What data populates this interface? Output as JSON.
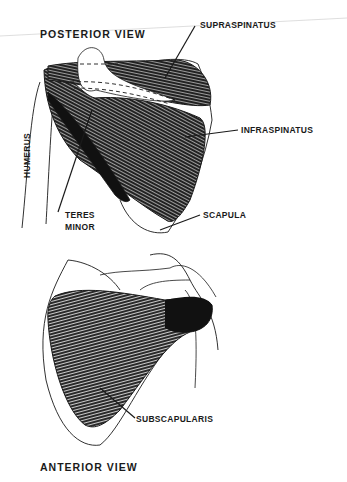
{
  "posterior": {
    "title": "POSTERIOR   VIEW",
    "labels": {
      "supraspinatus": "SUPRASPINATUS",
      "infraspinatus": "INFRASPINATUS",
      "humerus": "HUMERUS",
      "teres_minor_1": "TERES",
      "teres_minor_2": "MINOR",
      "scapula": "SCAPULA"
    }
  },
  "anterior": {
    "title": "ANTERIOR   VIEW",
    "labels": {
      "subscapularis": "SUBSCAPULARIS"
    }
  },
  "colors": {
    "ink": "#1a1a1a",
    "paper": "#ffffff",
    "rule": "#c8c8c8"
  }
}
